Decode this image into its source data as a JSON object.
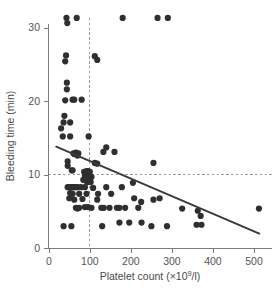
{
  "chart_data": {
    "type": "scatter",
    "title": "",
    "xlabel": "Platelet count (×10⁹/l)",
    "xlabel_parts": {
      "before": "Platelet count (×10",
      "sup": "9",
      "after": "/l)"
    },
    "ylabel": "Bleeding time (min)",
    "xlim": [
      0,
      540
    ],
    "ylim": [
      0,
      32
    ],
    "xticks": [
      0,
      100,
      200,
      300,
      400,
      500
    ],
    "xticklabels": [
      "0",
      "100",
      "200",
      "300",
      "400",
      "500"
    ],
    "yticks": [
      0,
      10,
      20,
      30
    ],
    "yticklabels": [
      "0",
      "10",
      "20",
      "30"
    ],
    "grid": false,
    "legend": null,
    "reference_lines": [
      {
        "name": "platelet-threshold",
        "orientation": "vertical",
        "value": 100,
        "style": "dashed",
        "color": "#9a9a9a"
      },
      {
        "name": "bleeding-time-threshold",
        "orientation": "horizontal",
        "value": 10,
        "style": "dashed",
        "color": "#9a9a9a"
      }
    ],
    "fit_line": {
      "name": "regression-line",
      "x_start": 18,
      "y_start": 13.8,
      "x_end": 513,
      "y_end": 2.0,
      "color": "#3a3a3a"
    },
    "marker": {
      "shape": "circle",
      "color": "#2f2f2f",
      "size_px": 3.1
    },
    "points": [
      [
        43,
        31.3
      ],
      [
        45,
        30.6
      ],
      [
        68,
        31.3
      ],
      [
        180,
        31.3
      ],
      [
        265,
        31.3
      ],
      [
        290,
        31.3
      ],
      [
        42,
        26.2
      ],
      [
        40,
        25.4
      ],
      [
        112,
        26.1
      ],
      [
        118,
        25.6
      ],
      [
        44,
        22.5
      ],
      [
        44,
        21.6
      ],
      [
        40,
        20.1
      ],
      [
        58,
        20.2
      ],
      [
        62,
        20.2
      ],
      [
        80,
        20.2
      ],
      [
        38,
        18.0
      ],
      [
        36,
        17.1
      ],
      [
        52,
        17.1
      ],
      [
        30,
        16.3
      ],
      [
        34,
        15.2
      ],
      [
        52,
        15.2
      ],
      [
        97,
        15.2
      ],
      [
        140,
        13.7
      ],
      [
        160,
        13.1
      ],
      [
        133,
        13.1
      ],
      [
        60,
        12.9
      ],
      [
        62,
        12.8
      ],
      [
        66,
        13.0
      ],
      [
        70,
        12.6
      ],
      [
        72,
        12.9
      ],
      [
        46,
        11.8
      ],
      [
        46,
        11.2
      ],
      [
        112,
        11.6
      ],
      [
        118,
        11.5
      ],
      [
        255,
        11.6
      ],
      [
        56,
        10.6
      ],
      [
        58,
        10.6
      ],
      [
        86,
        10.4
      ],
      [
        92,
        10.5
      ],
      [
        96,
        10.5
      ],
      [
        100,
        10.4
      ],
      [
        88,
        9.9
      ],
      [
        92,
        9.8
      ],
      [
        96,
        9.6
      ],
      [
        100,
        9.7
      ],
      [
        104,
        9.7
      ],
      [
        84,
        9.3
      ],
      [
        90,
        9.2
      ],
      [
        94,
        9.0
      ],
      [
        98,
        9.1
      ],
      [
        102,
        9.0
      ],
      [
        46,
        8.3
      ],
      [
        50,
        8.3
      ],
      [
        54,
        8.3
      ],
      [
        58,
        8.3
      ],
      [
        62,
        8.3
      ],
      [
        66,
        8.3
      ],
      [
        70,
        8.3
      ],
      [
        78,
        8.3
      ],
      [
        88,
        8.3
      ],
      [
        108,
        8.2
      ],
      [
        140,
        8.3
      ],
      [
        178,
        8.3
      ],
      [
        52,
        7.5
      ],
      [
        58,
        7.4
      ],
      [
        74,
        7.4
      ],
      [
        92,
        7.4
      ],
      [
        120,
        7.4
      ],
      [
        152,
        7.4
      ],
      [
        205,
        8.9
      ],
      [
        50,
        6.8
      ],
      [
        62,
        6.6
      ],
      [
        82,
        6.7
      ],
      [
        118,
        6.6
      ],
      [
        208,
        6.8
      ],
      [
        225,
        6.3
      ],
      [
        255,
        6.6
      ],
      [
        270,
        6.8
      ],
      [
        66,
        5.5
      ],
      [
        70,
        5.4
      ],
      [
        74,
        5.5
      ],
      [
        88,
        5.6
      ],
      [
        96,
        5.6
      ],
      [
        104,
        5.5
      ],
      [
        128,
        5.5
      ],
      [
        134,
        5.5
      ],
      [
        148,
        5.5
      ],
      [
        166,
        5.5
      ],
      [
        172,
        5.5
      ],
      [
        186,
        5.5
      ],
      [
        218,
        5.5
      ],
      [
        325,
        5.4
      ],
      [
        363,
        5.1
      ],
      [
        370,
        4.4
      ],
      [
        512,
        5.4
      ],
      [
        36,
        3.0
      ],
      [
        55,
        3.0
      ],
      [
        130,
        3.0
      ],
      [
        172,
        3.5
      ],
      [
        196,
        3.5
      ],
      [
        226,
        3.5
      ],
      [
        250,
        3.0
      ],
      [
        288,
        3.0
      ],
      [
        360,
        3.2
      ],
      [
        372,
        3.2
      ]
    ]
  }
}
